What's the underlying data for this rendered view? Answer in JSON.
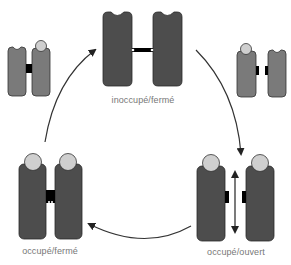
{
  "diagram": {
    "type": "cycle",
    "colors": {
      "dark_block": "#4d4d4d",
      "light_block": "#7a7a7a",
      "ligand": "#cfcfcf",
      "connector": "#000000",
      "arrow": "#333333",
      "label": "#777777"
    },
    "states": [
      {
        "id": "inoccupe-ferme",
        "label": "inoccupé/fermé"
      },
      {
        "id": "occupe-ouvert",
        "label": "occupé/ouvert"
      },
      {
        "id": "occupe-ferme",
        "label": "occupé/fermé"
      }
    ],
    "intermediates": [
      {
        "id": "top-left",
        "description": "partially occupied, closed"
      },
      {
        "id": "top-right",
        "description": "partially occupied, open"
      }
    ],
    "arrows": [
      {
        "from": "inoccupe-ferme",
        "to": "occupe-ouvert",
        "direction": "clockwise"
      },
      {
        "from": "occupe-ouvert",
        "to": "occupe-ferme",
        "direction": "clockwise"
      },
      {
        "from": "occupe-ferme",
        "to": "inoccupe-ferme",
        "direction": "clockwise"
      }
    ]
  }
}
